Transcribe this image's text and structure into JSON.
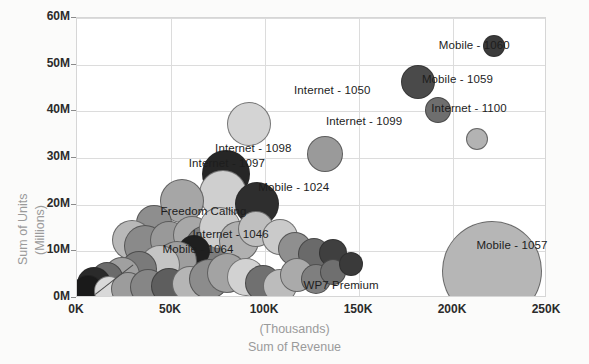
{
  "chart_data": {
    "type": "scatter",
    "title": "",
    "xlabel": "Sum of Revenue",
    "xlabel_unit": "(Thousands)",
    "ylabel": "Sum of Units",
    "ylabel_unit": "(Millions)",
    "xlim": [
      0,
      250
    ],
    "ylim": [
      0,
      60
    ],
    "xticks": [
      "0K",
      "50K",
      "100K",
      "150K",
      "200K",
      "250K"
    ],
    "xtick_values": [
      0,
      50,
      100,
      150,
      200,
      250
    ],
    "yticks": [
      "0M",
      "10M",
      "20M",
      "30M",
      "40M",
      "50M",
      "60M"
    ],
    "ytick_values": [
      0,
      10,
      20,
      30,
      40,
      50,
      60
    ],
    "grid": true,
    "legend": "none",
    "x_unit": "Thousands",
    "y_unit": "Millions",
    "size_meaning": "bubble-size",
    "annotations": [
      {
        "label": "Mobile - 1060",
        "x": 193,
        "y": 53.5
      },
      {
        "label": "Mobile - 1059",
        "x": 184,
        "y": 46.2
      },
      {
        "label": "Internet - 1100",
        "x": 189,
        "y": 40.0
      },
      {
        "label": "Internet - 1050",
        "x": 116,
        "y": 44.0
      },
      {
        "label": "Internet - 1099",
        "x": 133,
        "y": 37.2
      },
      {
        "label": "Internet - 1098",
        "x": 74,
        "y": 31.5
      },
      {
        "label": "Internet - 1097",
        "x": 60,
        "y": 28.2
      },
      {
        "label": "Mobile - 1024",
        "x": 97,
        "y": 23.2
      },
      {
        "label": "Freedom Calling",
        "x": 45,
        "y": 18.0
      },
      {
        "label": "Internet - 1046",
        "x": 62,
        "y": 13.0
      },
      {
        "label": "Mobile - 1064",
        "x": 46,
        "y": 9.8
      },
      {
        "label": "WP7 Premium",
        "x": 121,
        "y": 2.2
      },
      {
        "label": "Mobile - 1057",
        "x": 213,
        "y": 10.8
      }
    ],
    "points": [
      {
        "name": "Mobile - 1060",
        "x": 222.0,
        "y": 54.0,
        "size": 11,
        "shade": "#3b3b3b"
      },
      {
        "name": "Mobile - 1059",
        "x": 181.5,
        "y": 46.3,
        "size": 17,
        "shade": "#4a4a4a"
      },
      {
        "name": "Internet - 1100",
        "x": 192.0,
        "y": 40.2,
        "size": 13,
        "shade": "#6e6e6e"
      },
      {
        "name": "Internet - 1100b",
        "x": 213.0,
        "y": 34.0,
        "size": 11,
        "shade": "#b3b3b3"
      },
      {
        "name": "Internet - 1050",
        "x": 91.5,
        "y": 37.2,
        "size": 22,
        "shade": "#d4d4d4"
      },
      {
        "name": "Internet - 1099",
        "x": 132.0,
        "y": 30.8,
        "size": 18,
        "shade": "#9a9a9a"
      },
      {
        "name": "Internet - 1097",
        "x": 79.0,
        "y": 26.5,
        "size": 24,
        "shade": "#262626"
      },
      {
        "name": "Internet - 1098",
        "x": 77.5,
        "y": 22.3,
        "size": 24,
        "shade": "#cfcfcf"
      },
      {
        "name": "Mobile - 1024",
        "x": 96.0,
        "y": 20.2,
        "size": 22,
        "shade": "#2e2e2e"
      },
      {
        "name": "p-a",
        "x": 56.0,
        "y": 20.8,
        "size": 22,
        "shade": "#a6a6a6"
      },
      {
        "name": "p-b",
        "x": 41.0,
        "y": 16.0,
        "size": 18,
        "shade": "#8e8e8e"
      },
      {
        "name": "p-c",
        "x": 29.0,
        "y": 12.5,
        "size": 20,
        "shade": "#b8b8b8"
      },
      {
        "name": "p-d",
        "x": 36.0,
        "y": 11.2,
        "size": 21,
        "shade": "#8a8a8a"
      },
      {
        "name": "p-e",
        "x": 49.0,
        "y": 12.4,
        "size": 19,
        "shade": "#999999"
      },
      {
        "name": "p-f",
        "x": 61.0,
        "y": 13.5,
        "size": 19,
        "shade": "#a8a8a8"
      },
      {
        "name": "p-g",
        "x": 69.0,
        "y": 11.0,
        "size": 22,
        "shade": "#7d7d7d"
      },
      {
        "name": "p-h",
        "x": 76.0,
        "y": 15.0,
        "size": 21,
        "shade": "#cdcdcd"
      },
      {
        "name": "p-i",
        "x": 86.0,
        "y": 12.2,
        "size": 20,
        "shade": "#b0b0b0"
      },
      {
        "name": "p-j",
        "x": 95.0,
        "y": 14.8,
        "size": 18,
        "shade": "#bfbfbf"
      },
      {
        "name": "p-k",
        "x": 108.0,
        "y": 13.0,
        "size": 18,
        "shade": "#cacaca"
      },
      {
        "name": "p-l",
        "x": 116.0,
        "y": 10.5,
        "size": 17,
        "shade": "#8f8f8f"
      },
      {
        "name": "p-m",
        "x": 126.0,
        "y": 9.5,
        "size": 16,
        "shade": "#6a6a6a"
      },
      {
        "name": "p-n",
        "x": 136.0,
        "y": 9.6,
        "size": 14,
        "shade": "#3f3f3f"
      },
      {
        "name": "p-o",
        "x": 62.0,
        "y": 10.0,
        "size": 16,
        "shade": "#1f1f1f"
      },
      {
        "name": "p-p",
        "x": 53.0,
        "y": 8.0,
        "size": 20,
        "shade": "#9e9e9e"
      },
      {
        "name": "p-q",
        "x": 44.0,
        "y": 7.0,
        "size": 20,
        "shade": "#c4c4c4"
      },
      {
        "name": "p-r",
        "x": 33.0,
        "y": 6.2,
        "size": 18,
        "shade": "#7a7a7a"
      },
      {
        "name": "p-s",
        "x": 24.0,
        "y": 5.0,
        "size": 18,
        "shade": "#a0a0a0"
      },
      {
        "name": "p-t",
        "x": 16.0,
        "y": 4.2,
        "size": 16,
        "shade": "#6b6b6b"
      },
      {
        "name": "p-u",
        "x": 9.0,
        "y": 3.0,
        "size": 17,
        "shade": "#2a2a2a"
      },
      {
        "name": "p-v",
        "x": 6.0,
        "y": 1.8,
        "size": 15,
        "shade": "#1a1a1a"
      },
      {
        "name": "p-w",
        "x": 17.0,
        "y": 1.6,
        "size": 15,
        "shade": "#d9d9d9"
      },
      {
        "name": "p-x",
        "x": 27.0,
        "y": 2.0,
        "size": 17,
        "shade": "#9c9c9c"
      },
      {
        "name": "p-y",
        "x": 38.0,
        "y": 2.4,
        "size": 18,
        "shade": "#868686"
      },
      {
        "name": "p-z",
        "x": 49.0,
        "y": 2.6,
        "size": 18,
        "shade": "#5e5e5e"
      },
      {
        "name": "p-aa",
        "x": 60.0,
        "y": 3.0,
        "size": 18,
        "shade": "#b5b5b5"
      },
      {
        "name": "p-ab",
        "x": 70.0,
        "y": 4.0,
        "size": 20,
        "shade": "#8c8c8c"
      },
      {
        "name": "p-ac",
        "x": 80.0,
        "y": 5.4,
        "size": 20,
        "shade": "#a3a3a3"
      },
      {
        "name": "p-ad",
        "x": 90.0,
        "y": 4.6,
        "size": 19,
        "shade": "#d2d2d2"
      },
      {
        "name": "p-ae",
        "x": 99.0,
        "y": 3.2,
        "size": 18,
        "shade": "#707070"
      },
      {
        "name": "p-af",
        "x": 108.0,
        "y": 2.6,
        "size": 17,
        "shade": "#bcbcbc"
      },
      {
        "name": "p-ag",
        "x": 117.0,
        "y": 5.0,
        "size": 17,
        "shade": "#aaaaaa"
      },
      {
        "name": "p-ah",
        "x": 127.0,
        "y": 4.0,
        "size": 15,
        "shade": "#7f7f7f"
      },
      {
        "name": "p-ai",
        "x": 136.0,
        "y": 5.6,
        "size": 13,
        "shade": "#6f6f6f"
      },
      {
        "name": "p-aj",
        "x": 146.0,
        "y": 7.2,
        "size": 12,
        "shade": "#3a3a3a"
      },
      {
        "name": "Mobile - 1057",
        "x": 221.0,
        "y": 5.8,
        "size": 50,
        "shade": "#b6b6b6"
      }
    ]
  },
  "axes": {
    "x_title_line1": "(Thousands)",
    "x_title_line2": "Sum of Revenue",
    "y_title_line1": "Sum of Units",
    "y_title_line2": "(Millions)"
  },
  "colors": {
    "plot_background": "#ffffff",
    "page_background": "#fbfbfa",
    "gridline": "#dcdcdc",
    "axis_text": "#2b2b2b",
    "axis_title_text": "#9a9a9a",
    "label_text": "#1d1d1d"
  }
}
